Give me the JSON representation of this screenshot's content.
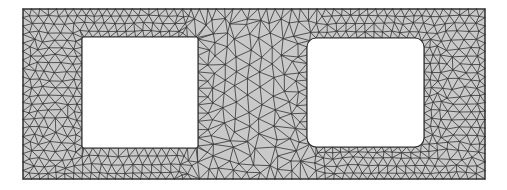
{
  "figure": {
    "kind": "fem-mesh-2d",
    "canvas": {
      "width": 507,
      "height": 190,
      "background": "#ffffff"
    }
  },
  "style": {
    "domain_fill": "#c9c9c9",
    "hole_fill": "#ffffff",
    "edge_color": "#3b3b3b",
    "edge_width": 0.85,
    "boundary_color": "#2a2a2a",
    "boundary_width": 1.1,
    "node_color": "#1e1e1e",
    "node_radius": 0.0
  },
  "geometry": {
    "outer_rect": {
      "x": 23,
      "y": 9,
      "width": 462,
      "height": 170
    },
    "holes": [
      {
        "name": "left-square-hole",
        "x": 82,
        "y": 37,
        "width": 116,
        "height": 111,
        "corner_radius": 2
      },
      {
        "name": "right-square-hole",
        "x": 307,
        "y": 38,
        "width": 117,
        "height": 109,
        "corner_radius": 9
      }
    ]
  },
  "mesh_params": {
    "target_edge_length": 9.2,
    "boundary_refinement": 1.0,
    "interior_coarsening": 1.55,
    "mid_band": {
      "x0": 198,
      "x1": 307,
      "coarsen": 1.9
    },
    "seed": 20250614,
    "relaxation_iterations": 9,
    "jitter": 0.26
  },
  "chart_data": {
    "type": "mesh",
    "element_type": "linear triangle (T3)",
    "domain": "rectangle with two rectangular cutouts",
    "outer_boundary": [
      [
        23,
        9
      ],
      [
        485,
        9
      ],
      [
        485,
        179
      ],
      [
        23,
        179
      ]
    ],
    "hole_boundaries": [
      [
        [
          82,
          37
        ],
        [
          198,
          37
        ],
        [
          198,
          148
        ],
        [
          82,
          148
        ]
      ],
      [
        [
          307,
          38
        ],
        [
          424,
          38
        ],
        [
          424,
          147
        ],
        [
          307,
          147
        ]
      ]
    ],
    "regions": [
      {
        "name": "left-strip",
        "x_range": [
          23,
          82
        ],
        "density": "fine-structured"
      },
      {
        "name": "top-strip",
        "x_range": [
          23,
          485
        ],
        "y_range": [
          9,
          37
        ],
        "density": "fine-structured"
      },
      {
        "name": "mid-band",
        "x_range": [
          198,
          307
        ],
        "density": "coarse-irregular"
      },
      {
        "name": "bottom-strip",
        "x_range": [
          23,
          485
        ],
        "y_range": [
          148,
          179
        ],
        "density": "fine-structured"
      },
      {
        "name": "right-strip",
        "x_range": [
          424,
          485
        ],
        "density": "fine-structured"
      }
    ],
    "grid": false,
    "legend": "none",
    "axes": "none"
  }
}
